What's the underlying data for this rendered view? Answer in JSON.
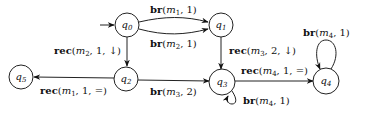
{
  "diagram": {
    "type": "automaton",
    "initial_state": "q0",
    "nodes": [
      {
        "id": "q0",
        "name": "q",
        "sub": "0",
        "x": 127,
        "y": 25
      },
      {
        "id": "q1",
        "name": "q",
        "sub": "1",
        "x": 221,
        "y": 25
      },
      {
        "id": "q2",
        "name": "q",
        "sub": "2",
        "x": 126,
        "y": 79
      },
      {
        "id": "q3",
        "name": "q",
        "sub": "3",
        "x": 222,
        "y": 82
      },
      {
        "id": "q4",
        "name": "q",
        "sub": "4",
        "x": 326,
        "y": 81
      },
      {
        "id": "q5",
        "name": "q",
        "sub": "5",
        "x": 21,
        "y": 77
      }
    ],
    "edges": [
      {
        "from": "q0",
        "to": "q1",
        "kw": "br",
        "msg": "m",
        "msg_sub": "1",
        "args": ", 1)",
        "label": "br(m1, 1)"
      },
      {
        "from": "q0",
        "to": "q1",
        "kw": "br",
        "msg": "m",
        "msg_sub": "2",
        "args": ", 1)",
        "label": "br(m2, 1)"
      },
      {
        "from": "q0",
        "to": "q2",
        "kw": "rec",
        "msg": "m",
        "msg_sub": "2",
        "args": ", 1, ↓)",
        "label": "rec(m2, 1, ↓)"
      },
      {
        "from": "q1",
        "to": "q3",
        "kw": "rec",
        "msg": "m",
        "msg_sub": "3",
        "args": ", 2, ↓)",
        "label": "rec(m3, 2, ↓)"
      },
      {
        "from": "q2",
        "to": "q5",
        "kw": "rec",
        "msg": "m",
        "msg_sub": "1",
        "args": ", 1, =)",
        "label": "rec(m1, 1, =)"
      },
      {
        "from": "q2",
        "to": "q3",
        "kw": "br",
        "msg": "m",
        "msg_sub": "3",
        "args": ", 2)",
        "label": "br(m3, 2)"
      },
      {
        "from": "q3",
        "to": "q4",
        "kw": "rec",
        "msg": "m",
        "msg_sub": "4",
        "args": ", 1, =)",
        "label": "rec(m4, 1, =)"
      },
      {
        "from": "q3",
        "to": "q3",
        "kw": "br",
        "msg": "m",
        "msg_sub": "4",
        "args": ", 1)",
        "label": "br(m4, 1)"
      },
      {
        "from": "q4",
        "to": "q4",
        "kw": "br",
        "msg": "m",
        "msg_sub": "4",
        "args": ", 1)",
        "label": "br(m4, 1)"
      }
    ]
  }
}
